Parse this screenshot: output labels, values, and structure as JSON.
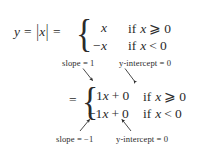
{
  "figure": {
    "background_color": "#ffffff",
    "text_color": "#2b2b2b",
    "width": 212,
    "height": 156
  },
  "equation": {
    "lead_y": "y",
    "lead_equals_1": "=",
    "abs_open": "|",
    "abs_var": "x",
    "abs_close": "|",
    "lead_equals_2": "=",
    "second_equals": "=",
    "brace_glyph": "{"
  },
  "block1": {
    "cases": [
      {
        "value": "x",
        "condition_keyword": "if",
        "condition_variable": "x",
        "condition_relation": "⩾",
        "condition_value": "0"
      },
      {
        "value": "−x",
        "condition_keyword": "if",
        "condition_variable": "x",
        "condition_relation": "<",
        "condition_value": "0"
      }
    ]
  },
  "block2": {
    "cases": [
      {
        "coefficient": "1",
        "variable": "x",
        "plus": "+",
        "intercept": "0",
        "condition_keyword": "if",
        "condition_variable": "x",
        "condition_relation": "⩾",
        "condition_value": "0"
      },
      {
        "coefficient": "−1",
        "variable": "x",
        "plus": "+",
        "intercept": "0",
        "condition_keyword": "if",
        "condition_variable": "x",
        "condition_relation": "<",
        "condition_value": "0"
      }
    ]
  },
  "annotations": {
    "slope_top": {
      "label": "slope",
      "equals": "=",
      "value": "1",
      "full_text": "slope = 1",
      "arrow_direction": "down-right"
    },
    "yintercept_top": {
      "label_variable": "y",
      "label_rest": "-intercept",
      "equals": "=",
      "value": "0",
      "full_text": "y-intercept = 0",
      "arrow_direction": "down-left"
    },
    "slope_bottom": {
      "label": "slope",
      "equals": "=",
      "value": "−1",
      "full_text": "slope = −1",
      "arrow_direction": "up-right"
    },
    "yintercept_bottom": {
      "label_variable": "y",
      "label_rest": "-intercept",
      "equals": "=",
      "value": "0",
      "full_text": "y-intercept = 0",
      "arrow_direction": "up-left"
    }
  },
  "colors": {
    "text": "#2b2b2b",
    "arrow": "#2b2b2b",
    "background": "#ffffff"
  }
}
